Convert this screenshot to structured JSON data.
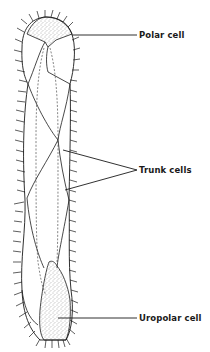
{
  "figure": {
    "type": "anatomical-diagram",
    "colors": {
      "ink": "#1a1a1a",
      "stipple": "#555555",
      "background": "#ffffff"
    }
  },
  "labels": {
    "polar": "Polar cell",
    "trunk": "Trunk cells",
    "uropolar": "Uropolar cell"
  },
  "label_positions": {
    "polar": {
      "x": 139,
      "y": 30
    },
    "trunk": {
      "x": 139,
      "y": 165
    },
    "uropolar": {
      "x": 139,
      "y": 313
    }
  },
  "leader_lines": {
    "polar": [
      [
        72,
        35
      ],
      [
        137,
        35
      ]
    ],
    "trunk": [
      [
        [
          63,
          150
        ],
        [
          137,
          170
        ]
      ],
      [
        [
          65,
          190
        ],
        [
          137,
          170
        ]
      ]
    ],
    "uropolar": [
      [
        58,
        318
      ],
      [
        137,
        318
      ]
    ]
  }
}
